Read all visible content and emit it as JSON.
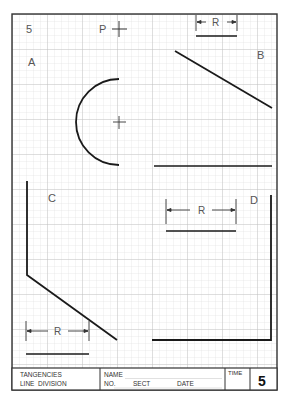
{
  "sheet": {
    "number": "5",
    "point_label": "P",
    "problem_labels": {
      "a": "A",
      "b": "B",
      "c": "C",
      "d": "D"
    },
    "radius_label": "R"
  },
  "title_block": {
    "title_line1": "TANGENCIES",
    "title_line2": "LINE  DIVISION",
    "name_label": "NAME",
    "no_label": "NO.",
    "sect_label": "SECT",
    "date_label": "DATE",
    "time_label": "TIME",
    "sheet_number": "5"
  },
  "colors": {
    "grid_minor": "#d9d9d9",
    "grid_major": "#bdbdbd",
    "ink": "#1a1a1a",
    "paper": "#ffffff"
  }
}
